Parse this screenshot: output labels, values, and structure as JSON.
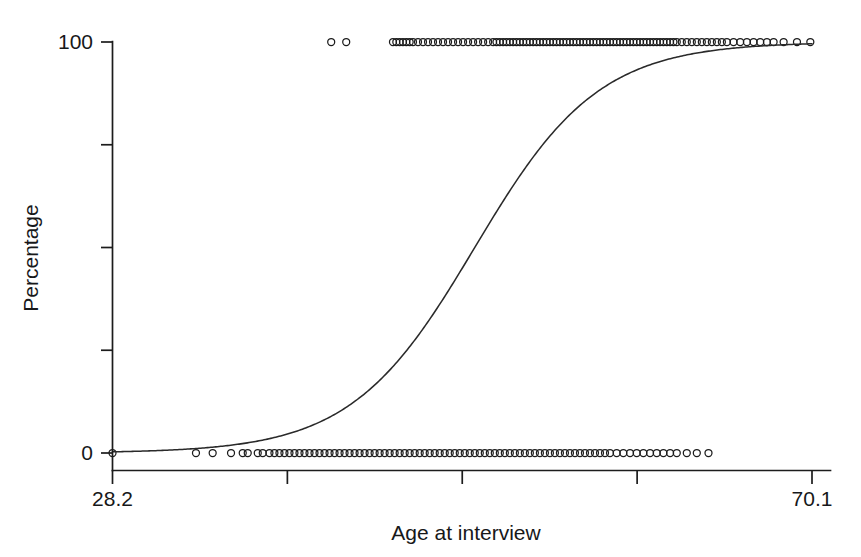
{
  "chart_data": {
    "type": "scatter",
    "title": "",
    "subtitle": "",
    "xlabel": "Age at interview",
    "ylabel": "Percentage",
    "xlim": [
      28.2,
      70.1
    ],
    "ylim": [
      0,
      100
    ],
    "grid": false,
    "legend": null,
    "x_ticks": [
      {
        "value": 28.2,
        "label": "28.2"
      },
      {
        "value": 38.675,
        "label": ""
      },
      {
        "value": 49.15,
        "label": ""
      },
      {
        "value": 59.625,
        "label": ""
      },
      {
        "value": 70.1,
        "label": "70.1"
      }
    ],
    "y_ticks": [
      {
        "value": 0,
        "label": "0"
      },
      {
        "value": 25,
        "label": ""
      },
      {
        "value": 50,
        "label": ""
      },
      {
        "value": 75,
        "label": ""
      },
      {
        "value": 100,
        "label": "100"
      }
    ],
    "series": [
      {
        "name": "Observed responses",
        "type": "scatter",
        "marker": "open-circle",
        "marker_size": 7,
        "color": "#1b1b1b",
        "points_y100": [
          41.3,
          42.2,
          45.0,
          45.2,
          45.4,
          45.6,
          45.8,
          46.0,
          46.2,
          46.5,
          46.8,
          47.1,
          47.4,
          47.7,
          48.0,
          48.3,
          48.6,
          48.9,
          49.2,
          49.5,
          49.8,
          50.1,
          50.4,
          50.7,
          51.0,
          51.2,
          51.4,
          51.6,
          51.8,
          52.0,
          52.2,
          52.4,
          52.6,
          52.8,
          53.0,
          53.2,
          53.4,
          53.6,
          53.8,
          54.0,
          54.2,
          54.4,
          54.6,
          54.8,
          55.0,
          55.2,
          55.4,
          55.6,
          55.8,
          56.0,
          56.2,
          56.4,
          56.6,
          56.8,
          57.0,
          57.2,
          57.4,
          57.6,
          57.8,
          58.0,
          58.2,
          58.4,
          58.6,
          58.8,
          59.0,
          59.2,
          59.4,
          59.6,
          59.8,
          60.0,
          60.2,
          60.4,
          60.6,
          60.8,
          61.0,
          61.2,
          61.4,
          61.6,
          61.8,
          62.0,
          62.3,
          62.6,
          62.9,
          63.2,
          63.5,
          63.8,
          64.1,
          64.4,
          64.7,
          65.0,
          65.4,
          65.8,
          66.2,
          66.6,
          67.0,
          67.4,
          67.8,
          68.4,
          69.2,
          70.0
        ],
        "points_y0": [
          28.2,
          33.2,
          34.2,
          35.3,
          36.0,
          36.3,
          36.9,
          37.2,
          37.6,
          37.9,
          38.2,
          38.5,
          38.8,
          39.1,
          39.4,
          39.7,
          40.0,
          40.3,
          40.6,
          40.9,
          41.2,
          41.5,
          41.8,
          42.1,
          42.4,
          42.7,
          43.0,
          43.3,
          43.6,
          43.9,
          44.2,
          44.5,
          44.8,
          45.1,
          45.4,
          45.7,
          46.0,
          46.3,
          46.6,
          46.9,
          47.2,
          47.5,
          47.8,
          48.1,
          48.4,
          48.7,
          49.0,
          49.3,
          49.6,
          49.9,
          50.2,
          50.5,
          50.8,
          51.1,
          51.4,
          51.7,
          52.0,
          52.3,
          52.6,
          52.9,
          53.2,
          53.5,
          53.8,
          54.1,
          54.4,
          54.7,
          55.0,
          55.3,
          55.6,
          55.9,
          56.2,
          56.5,
          56.8,
          57.1,
          57.4,
          57.7,
          58.0,
          58.4,
          58.8,
          59.2,
          59.6,
          60.0,
          60.4,
          60.8,
          61.2,
          61.6,
          62.0,
          62.6,
          63.2,
          63.9
        ]
      },
      {
        "name": "Fitted logistic curve",
        "type": "line",
        "color": "#2a2a2a",
        "model": "logistic",
        "midpoint_x": 49.9,
        "slope": 0.27,
        "ymin": 0,
        "ymax": 100
      }
    ]
  }
}
